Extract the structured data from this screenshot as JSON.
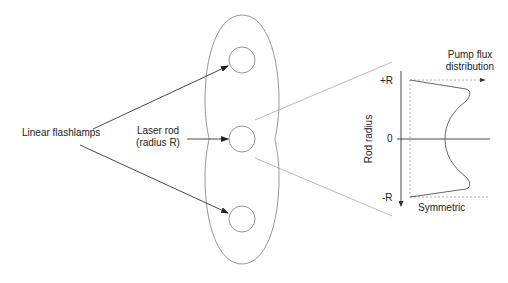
{
  "diagram": {
    "type": "laser pump cavity schematic",
    "labels": {
      "flashlamps": "Linear flashlamps",
      "rod_line1": "Laser rod",
      "rod_line2": "(radius R)",
      "flux_line1": "Pump flux",
      "flux_line2": "distribution",
      "plus_r": "+R",
      "zero": "0",
      "minus_r": "-R",
      "y_axis": "Rod radius",
      "symmetric": "Symmetric"
    },
    "elements": [
      {
        "id": "cavity",
        "shape": "double-ellipse reflector"
      },
      {
        "id": "lamp-top",
        "shape": "circle"
      },
      {
        "id": "rod-center",
        "shape": "circle"
      },
      {
        "id": "lamp-bottom",
        "shape": "circle"
      }
    ],
    "colors": {
      "line": "#333333",
      "light_line": "#9a9a9a",
      "dashed": "#aaaaaa"
    }
  }
}
